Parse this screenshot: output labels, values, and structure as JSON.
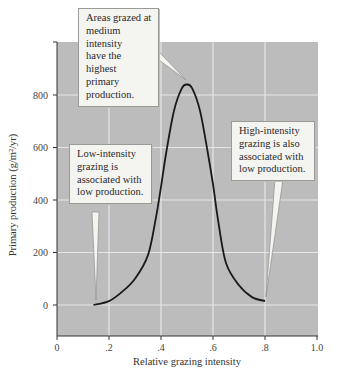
{
  "chart_data": {
    "type": "line",
    "title": "",
    "xlabel": "Relative grazing intensity",
    "ylabel": "Primary production (g/m²/yr)",
    "xlim": [
      0,
      1.0
    ],
    "ylim": [
      -120,
      1000
    ],
    "x_ticks": [
      "0",
      ".2",
      ".4",
      ".6",
      ".8",
      "1.0"
    ],
    "y_ticks": [
      "0",
      "200",
      "400",
      "600",
      "800"
    ],
    "grid": true,
    "legend": null,
    "series": [
      {
        "name": "Primary production",
        "x": [
          0.14,
          0.2,
          0.25,
          0.3,
          0.35,
          0.38,
          0.4,
          0.42,
          0.45,
          0.48,
          0.5,
          0.52,
          0.55,
          0.58,
          0.6,
          0.62,
          0.65,
          0.7,
          0.75,
          0.8
        ],
        "values": [
          0,
          15,
          50,
          100,
          190,
          330,
          450,
          580,
          740,
          825,
          840,
          825,
          740,
          580,
          460,
          320,
          160,
          75,
          30,
          15
        ]
      }
    ],
    "annotations": [
      {
        "text": "Areas grazed at medium intensity have the highest primary production.",
        "points_to": [
          0.5,
          840
        ]
      },
      {
        "text": "Low-intensity grazing is associated with low production.",
        "points_to": [
          0.15,
          20
        ]
      },
      {
        "text": "High-intensity grazing is also associated with low production.",
        "points_to": [
          0.78,
          30
        ]
      }
    ],
    "plot_background": "#bcbcbc",
    "line_color": "#1a1a1a",
    "grid_color": "#e6e6e6"
  },
  "callouts": {
    "peak": [
      "Areas grazed at",
      "medium intensity",
      "have the highest",
      "primary",
      "production."
    ],
    "low": [
      "Low-intensity",
      "grazing is",
      "associated with",
      "low production."
    ],
    "high": [
      "High-intensity",
      "grazing is also",
      "associated with",
      "low production."
    ]
  }
}
